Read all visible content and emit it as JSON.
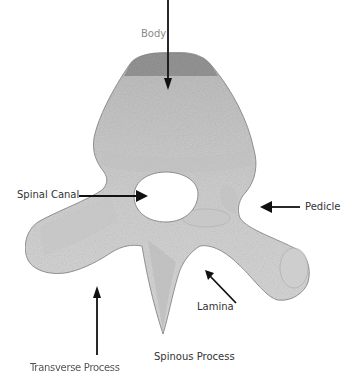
{
  "diagram": {
    "colors": {
      "bone_fill": "#d2d2d2",
      "bone_dark": "#a8a8a8",
      "body_top": "#8f8f8f",
      "outline": "#8c8c8c",
      "arrow": "#111111",
      "canal": "#ffffff"
    },
    "labels": {
      "body": "Body",
      "spinal_canal": "Spinal Canal",
      "pedicle": "Pedicle",
      "lamina": "Lamina",
      "transverse_process": "Transverse Process",
      "spinous_process": "Spinous Process"
    }
  }
}
